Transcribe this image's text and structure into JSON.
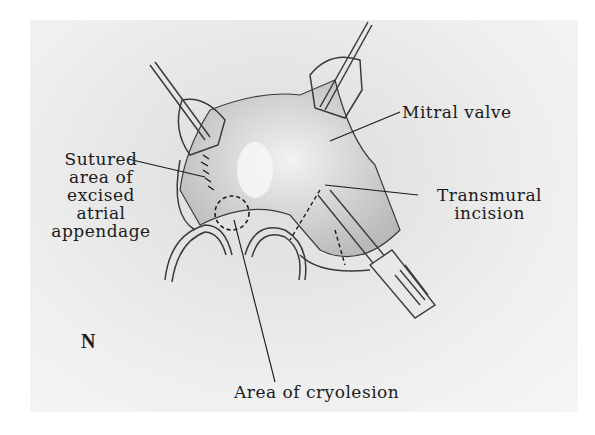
{
  "figure": {
    "panel_letter": "N",
    "labels": {
      "mitral_valve": "Mitral valve",
      "sutured_area": [
        "Sutured",
        "area of",
        "excised",
        "atrial",
        "appendage"
      ],
      "transmural_incision": [
        "Transmural",
        "incision"
      ],
      "area_of_cryolesion": "Area of cryolesion"
    },
    "colors": {
      "ink": "#1a1a1a",
      "paper": "#e8e8e8",
      "tissue": "#d2d2d2"
    }
  }
}
